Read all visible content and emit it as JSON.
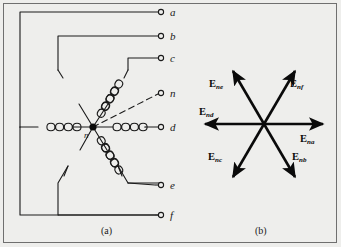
{
  "figure": {
    "background_color": "#eeeeec",
    "ink_color": "#1a1a1a",
    "captions": [
      {
        "id": "a",
        "text": "(a)",
        "x": 104,
        "y": 228
      },
      {
        "id": "b",
        "text": "(b)",
        "x": 258,
        "y": 228
      }
    ]
  },
  "winding_diagram": {
    "name": "six-phase-star-winding",
    "neutral_label": "n",
    "neutral_point": {
      "x": 93,
      "y": 127
    },
    "terminals": [
      {
        "label": "a",
        "x": 166,
        "y": 12,
        "dashed": false
      },
      {
        "label": "b",
        "x": 166,
        "y": 36,
        "dashed": false
      },
      {
        "label": "c",
        "x": 166,
        "y": 58,
        "dashed": false
      },
      {
        "label": "n",
        "x": 166,
        "y": 93,
        "dashed": true
      },
      {
        "label": "d",
        "x": 166,
        "y": 127,
        "dashed": false
      },
      {
        "label": "e",
        "x": 166,
        "y": 185,
        "dashed": false
      },
      {
        "label": "f",
        "x": 166,
        "y": 215,
        "dashed": false
      }
    ]
  },
  "phasor_diagram": {
    "name": "six-phase-voltage-phasors",
    "center": {
      "x": 264,
      "y": 124
    },
    "radius": 62,
    "phasors": [
      {
        "symbol": "E",
        "subscript": "na",
        "angle_deg": 0,
        "label_x": 300,
        "label_y": 134
      },
      {
        "symbol": "E",
        "subscript": "nb",
        "angle_deg": -60,
        "label_x": 292,
        "label_y": 152
      },
      {
        "symbol": "E",
        "subscript": "nc",
        "angle_deg": -120,
        "label_x": 210,
        "label_y": 152
      },
      {
        "symbol": "E",
        "subscript": "nd",
        "angle_deg": 180,
        "label_x": 200,
        "label_y": 108
      },
      {
        "symbol": "E",
        "subscript": "ne",
        "angle_deg": 120,
        "label_x": 211,
        "label_y": 80
      },
      {
        "symbol": "E",
        "subscript": "nf",
        "angle_deg": 60,
        "label_x": 291,
        "label_y": 80
      }
    ]
  }
}
